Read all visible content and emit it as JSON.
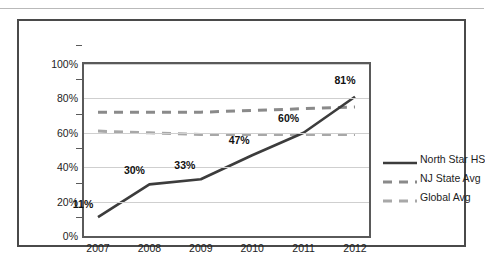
{
  "chart_data": {
    "type": "line",
    "title": "",
    "xlabel": "",
    "ylabel": "",
    "x": [
      "2007",
      "2008",
      "2009",
      "2010",
      "2011",
      "2012"
    ],
    "ylim": [
      0,
      100
    ],
    "yticks": [
      "0%",
      "20%",
      "40%",
      "60%",
      "80%",
      "100%"
    ],
    "ytick_values": [
      0,
      20,
      40,
      60,
      80,
      100
    ],
    "grid": true,
    "legend_position": "right",
    "series": [
      {
        "name": "North Star HS",
        "style": "solid",
        "color": "#3c3c3c",
        "values": [
          11,
          30,
          33,
          47,
          60,
          81
        ],
        "labels": [
          "11%",
          "30%",
          "33%",
          "47%",
          "60%",
          "81%"
        ]
      },
      {
        "name": "NJ State Avg",
        "style": "dashed",
        "color": "#8a8a8a",
        "values": [
          72,
          72,
          72,
          73,
          74,
          75
        ],
        "labels": []
      },
      {
        "name": "Global Avg",
        "style": "dashed",
        "color": "#a8a8a8",
        "values": [
          61,
          60,
          59,
          59,
          59,
          59
        ],
        "labels": []
      }
    ]
  },
  "colors": {
    "north_star": "#3c3c3c",
    "nj_state": "#8a8a8a",
    "global": "#a8a8a8",
    "grid": "#cfcfcf",
    "axis": "#5a5a5a",
    "frame": "#4a4a4a"
  }
}
